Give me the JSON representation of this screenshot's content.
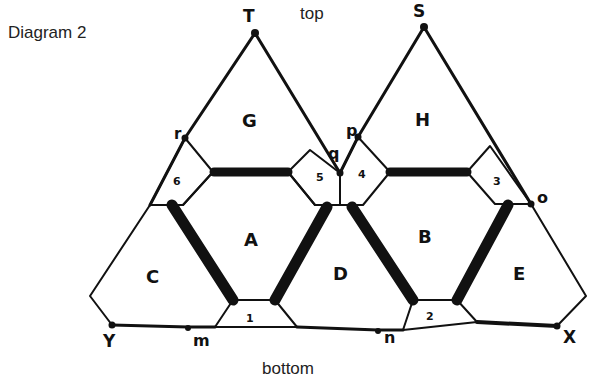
{
  "title": "Diagram 2",
  "orientation": {
    "top": "top",
    "bottom": "bottom"
  },
  "vertices": [
    {
      "id": "T",
      "label": "T"
    },
    {
      "id": "S",
      "label": "S"
    },
    {
      "id": "r",
      "label": "r"
    },
    {
      "id": "p",
      "label": "p"
    },
    {
      "id": "q",
      "label": "q"
    },
    {
      "id": "o",
      "label": "o"
    },
    {
      "id": "Y",
      "label": "Y"
    },
    {
      "id": "X",
      "label": "X"
    },
    {
      "id": "m",
      "label": "m"
    },
    {
      "id": "n",
      "label": "n"
    }
  ],
  "regions": [
    {
      "id": "G",
      "label": "G"
    },
    {
      "id": "H",
      "label": "H"
    },
    {
      "id": "A",
      "label": "A"
    },
    {
      "id": "B",
      "label": "B"
    },
    {
      "id": "C",
      "label": "C"
    },
    {
      "id": "D",
      "label": "D"
    },
    {
      "id": "E",
      "label": "E"
    }
  ],
  "small_regions": [
    {
      "id": "1",
      "label": "1"
    },
    {
      "id": "2",
      "label": "2"
    },
    {
      "id": "3",
      "label": "3"
    },
    {
      "id": "4",
      "label": "4"
    },
    {
      "id": "5",
      "label": "5"
    },
    {
      "id": "6",
      "label": "6"
    }
  ],
  "colors": {
    "line": "#111111",
    "background": "#ffffff"
  }
}
